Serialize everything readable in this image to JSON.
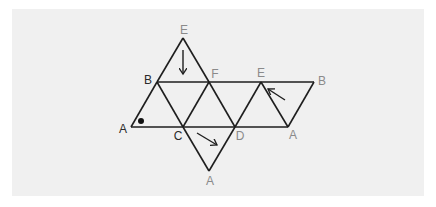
{
  "diagram": {
    "type": "net-of-octahedron",
    "colors": {
      "panel": "#f0f0f0",
      "line": "#1e1e1e",
      "label_dark": "#2a2a2a",
      "label_gray": "#8a8a8a"
    },
    "vertices": [
      {
        "id": "E_top",
        "label": "E",
        "x": 183,
        "y": 38,
        "lx": 184,
        "ly": 30,
        "tone": "gray"
      },
      {
        "id": "B_left",
        "label": "B",
        "x": 157,
        "y": 82,
        "lx": 148,
        "ly": 80,
        "tone": "dark"
      },
      {
        "id": "F",
        "label": "F",
        "x": 209,
        "y": 82,
        "lx": 215,
        "ly": 74,
        "tone": "gray"
      },
      {
        "id": "E_right",
        "label": "E",
        "x": 261,
        "y": 82,
        "lx": 261,
        "ly": 73,
        "tone": "gray"
      },
      {
        "id": "B_right",
        "label": "B",
        "x": 314,
        "y": 82,
        "lx": 322,
        "ly": 81,
        "tone": "gray"
      },
      {
        "id": "A_left",
        "label": "A",
        "x": 131,
        "y": 127,
        "lx": 123,
        "ly": 129,
        "tone": "dark"
      },
      {
        "id": "C",
        "label": "C",
        "x": 183,
        "y": 127,
        "lx": 178,
        "ly": 136,
        "tone": "dark"
      },
      {
        "id": "D",
        "label": "D",
        "x": 235,
        "y": 127,
        "lx": 240,
        "ly": 136,
        "tone": "gray"
      },
      {
        "id": "A_right",
        "label": "A",
        "x": 288,
        "y": 127,
        "lx": 293,
        "ly": 135,
        "tone": "gray"
      },
      {
        "id": "A_bottom",
        "label": "A",
        "x": 209,
        "y": 171,
        "lx": 210,
        "ly": 181,
        "tone": "gray"
      }
    ],
    "arrows": [
      {
        "name": "arrow-down-top-face",
        "x1": 183,
        "y1": 50,
        "x2": 183,
        "y2": 74
      },
      {
        "name": "arrow-diagonal-bottom-face",
        "x1": 197,
        "y1": 133,
        "x2": 217,
        "y2": 145
      },
      {
        "name": "arrow-diagonal-right-face",
        "x1": 285,
        "y1": 100,
        "x2": 268,
        "y2": 89
      }
    ],
    "marker": {
      "name": "angle-dot",
      "x": 141,
      "y": 121,
      "r": 3
    }
  }
}
